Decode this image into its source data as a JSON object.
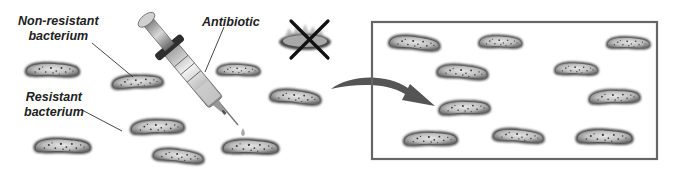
{
  "diagram": {
    "labels": {
      "non_resistant_line1": "Non-resistant",
      "non_resistant_line2": "bacterium",
      "resistant_line1": "Resistant",
      "resistant_line2": "bacterium",
      "antibiotic": "Antibiotic"
    },
    "colors": {
      "background": "#ffffff",
      "text": "#222222",
      "box_border": "#666666",
      "arrow": "#555555",
      "x_mark": "#111111",
      "bacterium_outline": "#5a5a5a",
      "bacterium_fill": "#bdbdbd"
    },
    "before_population": [
      {
        "cx": 52,
        "cy": 70,
        "w": 56,
        "h": 18
      },
      {
        "cx": 137,
        "cy": 82,
        "w": 52,
        "h": 16
      },
      {
        "cx": 238,
        "cy": 70,
        "w": 44,
        "h": 14
      },
      {
        "cx": 295,
        "cy": 97,
        "w": 54,
        "h": 17
      },
      {
        "cx": 157,
        "cy": 127,
        "w": 56,
        "h": 18
      },
      {
        "cx": 62,
        "cy": 146,
        "w": 58,
        "h": 18
      },
      {
        "cx": 178,
        "cy": 156,
        "w": 52,
        "h": 16
      },
      {
        "cx": 250,
        "cy": 147,
        "w": 58,
        "h": 18
      }
    ],
    "killed_bacterium": {
      "cx": 305,
      "cy": 40,
      "w": 52,
      "h": 16
    },
    "after_population": [
      {
        "cx": 414,
        "cy": 43,
        "w": 54,
        "h": 17
      },
      {
        "cx": 500,
        "cy": 42,
        "w": 44,
        "h": 15
      },
      {
        "cx": 628,
        "cy": 43,
        "w": 44,
        "h": 14
      },
      {
        "cx": 462,
        "cy": 72,
        "w": 54,
        "h": 17
      },
      {
        "cx": 576,
        "cy": 69,
        "w": 44,
        "h": 15
      },
      {
        "cx": 614,
        "cy": 97,
        "w": 54,
        "h": 17
      },
      {
        "cx": 464,
        "cy": 108,
        "w": 54,
        "h": 17
      },
      {
        "cx": 430,
        "cy": 139,
        "w": 56,
        "h": 17
      },
      {
        "cx": 518,
        "cy": 136,
        "w": 54,
        "h": 16
      },
      {
        "cx": 604,
        "cy": 137,
        "w": 58,
        "h": 18
      }
    ],
    "result_box": {
      "x": 372,
      "y": 22,
      "w": 285,
      "h": 137
    }
  }
}
